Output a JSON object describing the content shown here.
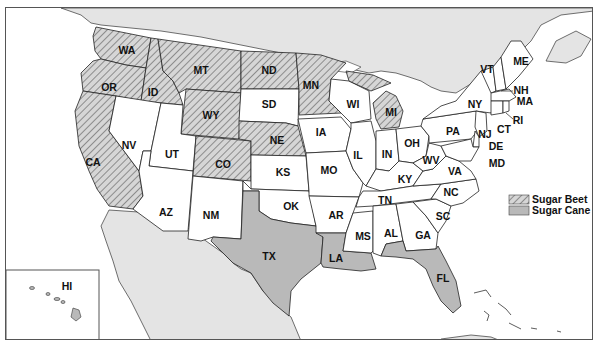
{
  "legend": {
    "items": [
      {
        "label": "Sugar Beet",
        "pattern": "diagonal-hatch",
        "color": "#b9b9b9"
      },
      {
        "label": "Sugar Cane",
        "pattern": "solid",
        "color": "#b9b9b9"
      }
    ]
  },
  "states": {
    "WA": "WA",
    "OR": "OR",
    "CA": "CA",
    "ID": "ID",
    "NV": "NV",
    "MT": "MT",
    "WY": "WY",
    "UT": "UT",
    "AZ": "AZ",
    "CO": "CO",
    "NM": "NM",
    "ND": "ND",
    "SD": "SD",
    "NE": "NE",
    "KS": "KS",
    "OK": "OK",
    "TX": "TX",
    "MN": "MN",
    "IA": "IA",
    "MO": "MO",
    "AR": "AR",
    "LA": "LA",
    "WI": "WI",
    "IL": "IL",
    "MS": "MS",
    "MI": "MI",
    "IN": "IN",
    "KY": "KY",
    "TN": "TN",
    "AL": "AL",
    "OH": "OH",
    "GA": "GA",
    "FL": "FL",
    "SC": "SC",
    "NC": "NC",
    "VA": "VA",
    "WV": "WV",
    "PA": "PA",
    "NY": "NY",
    "VT": "VT",
    "NH": "NH",
    "ME": "ME",
    "MA": "MA",
    "RI": "RI",
    "CT": "CT",
    "NJ": "NJ",
    "DE": "DE",
    "MD": "MD",
    "HI": "HI"
  },
  "categories": {
    "sugar_beet": [
      "WA",
      "OR",
      "CA",
      "ID",
      "MT",
      "WY",
      "CO",
      "ND",
      "NE",
      "MN",
      "MI"
    ],
    "sugar_cane": [
      "TX",
      "LA",
      "FL",
      "HI"
    ]
  },
  "colors": {
    "sugar_cane_fill": "#b9b9b9",
    "foreign_land": "#e4e4e4",
    "non_producing": "#ffffff",
    "border": "#222222"
  }
}
